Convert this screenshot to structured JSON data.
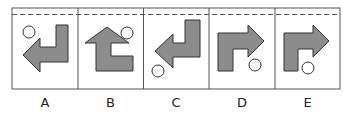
{
  "puzzle": {
    "options": [
      {
        "label": "A",
        "arrow_direction": "left",
        "circle_position": "top-left"
      },
      {
        "label": "B",
        "arrow_direction": "up",
        "circle_position": "top-right"
      },
      {
        "label": "C",
        "arrow_direction": "left",
        "circle_position": "bottom-left"
      },
      {
        "label": "D",
        "arrow_direction": "right",
        "circle_position": "bottom-right"
      },
      {
        "label": "E",
        "arrow_direction": "right",
        "circle_position": "bottom-center"
      }
    ],
    "colors": {
      "shape_fill": "#8c8c8c",
      "stroke": "#333333",
      "border": "#555555",
      "dashed_line": "#555555"
    }
  }
}
